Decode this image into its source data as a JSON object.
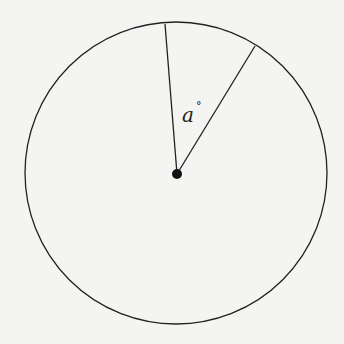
{
  "diagram": {
    "angle_label": "a",
    "angle_unit": "°",
    "colors": {
      "stroke": "#222222",
      "background": "#f4f4f2"
    }
  }
}
